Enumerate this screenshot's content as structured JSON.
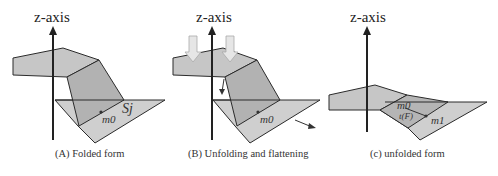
{
  "figure": {
    "panels": [
      {
        "id": "A",
        "axis_label": "z-axis",
        "caption": "(A) Folded form",
        "labels": {
          "point": "m0",
          "surface": "Sj"
        }
      },
      {
        "id": "B",
        "axis_label": "z-axis",
        "caption": "(B) Unfolding and flattening",
        "labels": {
          "point": "m0"
        }
      },
      {
        "id": "C",
        "axis_label": "z-axis",
        "caption": "(c) unfolded form",
        "labels": {
          "point0": "m0",
          "point1": "m1",
          "func": "t(F)"
        }
      }
    ]
  },
  "colors": {
    "face_light": "#cfcfcf",
    "face_mid": "#b9b9b9",
    "face_dark": "#a8a8a8",
    "edge": "#2b2b2b",
    "arrow_fill": "#e6e6e6"
  }
}
